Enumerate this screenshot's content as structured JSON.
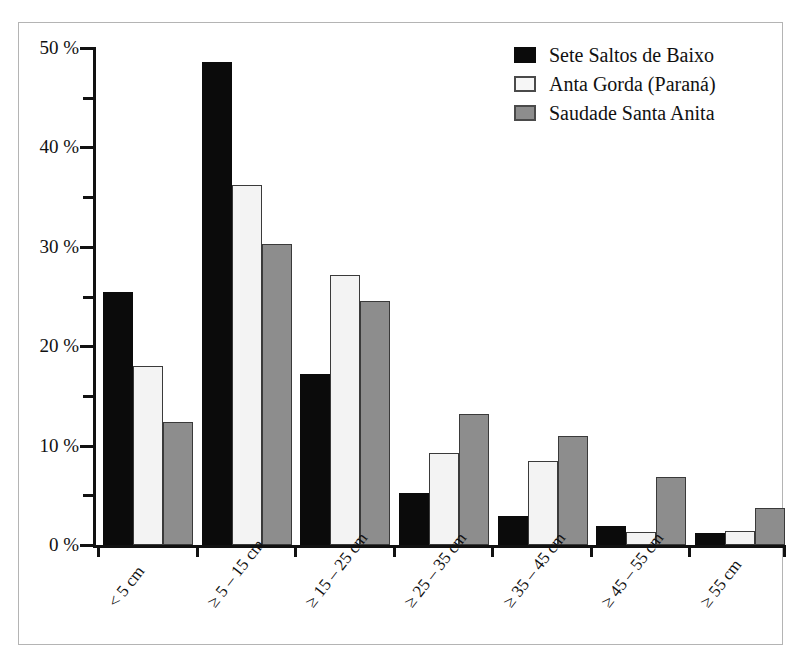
{
  "chart_data": {
    "type": "bar",
    "title": "",
    "subtitle": "",
    "xlabel": "",
    "ylabel": "",
    "ylim": [
      0,
      50
    ],
    "y_tick_format": "{v} %",
    "y_major_ticks": [
      0,
      10,
      20,
      30,
      40,
      50
    ],
    "y_major_tick_labels": [
      "0 %",
      "10 %",
      "20 %",
      "30 %",
      "40 %",
      "50 %"
    ],
    "y_minor_ticks": [
      5,
      15,
      25,
      35,
      45
    ],
    "grid": false,
    "legend_position": "top-right",
    "categories": [
      "< 5 cm",
      "≥ 5 – 15 cm",
      "≥ 15 – 25 cm",
      "≥ 25 – 35 cm",
      "≥ 35 – 45 cm",
      "≥ 45 – 55 cm",
      "≥ 55 cm"
    ],
    "series": [
      {
        "name": "Sete Saltos de Baixo",
        "color": "#0b0b0b",
        "values": [
          25.5,
          48.6,
          17.2,
          5.2,
          2.9,
          1.9,
          1.2
        ]
      },
      {
        "name": "Anta Gorda (Paraná)",
        "color": "#f3f3f3",
        "values": [
          18.0,
          36.2,
          27.2,
          9.3,
          8.5,
          1.3,
          1.4
        ]
      },
      {
        "name": "Saudade Santa Anita",
        "color": "#8d8d8d",
        "values": [
          12.4,
          30.3,
          24.5,
          13.2,
          11.0,
          6.8,
          3.7
        ]
      }
    ]
  },
  "legend": {
    "items": [
      {
        "label": "Sete Saltos de Baixo",
        "swatch": "black-square-icon"
      },
      {
        "label": "Anta Gorda (Paraná)",
        "swatch": "white-square-icon"
      },
      {
        "label": "Saudade Santa Anita",
        "swatch": "grey-square-icon"
      }
    ]
  }
}
